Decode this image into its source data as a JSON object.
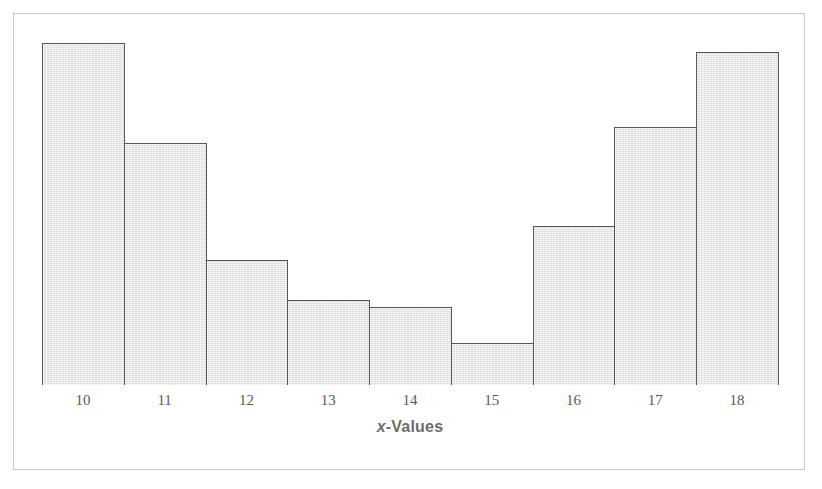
{
  "figure": {
    "background_color": "#ffffff",
    "frame_color": "#c9c9c9",
    "bar_fill_color": "#e5e5e5",
    "bar_edge_color": "#575757",
    "axis_color": "#4d4d4d",
    "tick_label_color": "#5a5a5a",
    "title_color": "#6d6d6d"
  },
  "axis": {
    "title_variable": "x",
    "title_rest": "-Values",
    "title_full": "x-Values"
  },
  "chart_data": {
    "type": "bar",
    "title": "",
    "subtitle": "",
    "xlabel": "x-Values",
    "ylabel": "",
    "categories": [
      "10",
      "11",
      "12",
      "13",
      "14",
      "15",
      "16",
      "17",
      "18"
    ],
    "values": [
      41,
      29,
      15,
      10,
      9,
      5,
      19,
      31,
      40
    ],
    "bar_pixel_heights": [
      342,
      242,
      125,
      85,
      78,
      42,
      159,
      258,
      333
    ],
    "xlim": [
      9.5,
      18.5
    ],
    "ylim": [
      0,
      41
    ],
    "bin_width": 1,
    "grid": false,
    "legend": null,
    "annotations": [],
    "series": [
      {
        "name": "Frequency",
        "values": [
          41,
          29,
          15,
          10,
          9,
          5,
          19,
          31,
          40
        ]
      }
    ]
  },
  "ticks": [
    {
      "label": "10"
    },
    {
      "label": "11"
    },
    {
      "label": "12"
    },
    {
      "label": "13"
    },
    {
      "label": "14"
    },
    {
      "label": "15"
    },
    {
      "label": "16"
    },
    {
      "label": "17"
    },
    {
      "label": "18"
    }
  ]
}
